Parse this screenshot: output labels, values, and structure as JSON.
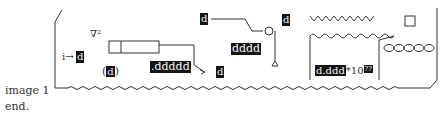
{
  "caption": {
    "image_label": "image 1",
    "end_label": "end."
  },
  "diagram": {
    "laplacian_symbol": "∇²",
    "input_arrow_label": "i→",
    "input_digit": "d",
    "paren_open": "(",
    "paren_digit": "d",
    "paren_close": ")",
    "decimal_readout": ".ddddd",
    "arrow_target_digit": "d",
    "top_digit": "d",
    "four_digit_readout": "dddd",
    "node_digit": "d",
    "scientific_mantissa": "d.ddd",
    "scientific_times": "*10",
    "scientific_exponent": "??"
  }
}
